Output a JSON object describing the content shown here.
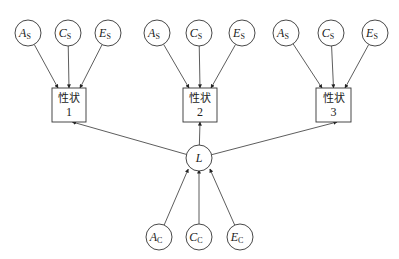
{
  "diagram": {
    "type": "path-diagram",
    "top_groups": [
      {
        "nodes": [
          {
            "letter": "A",
            "sub": "S",
            "x": 28
          },
          {
            "letter": "C",
            "sub": "S",
            "x": 68
          },
          {
            "letter": "E",
            "sub": "S",
            "x": 108
          }
        ],
        "trait": {
          "label": "性状",
          "number": "1",
          "x": 52,
          "w": 34
        }
      },
      {
        "nodes": [
          {
            "letter": "A",
            "sub": "S",
            "x": 157
          },
          {
            "letter": "C",
            "sub": "S",
            "x": 199
          },
          {
            "letter": "E",
            "sub": "S",
            "x": 242
          }
        ],
        "trait": {
          "label": "性状",
          "number": "2",
          "x": 183,
          "w": 34
        }
      },
      {
        "nodes": [
          {
            "letter": "A",
            "sub": "S",
            "x": 286
          },
          {
            "letter": "C",
            "sub": "S",
            "x": 331
          },
          {
            "letter": "E",
            "sub": "S",
            "x": 375
          }
        ],
        "trait": {
          "label": "性状",
          "number": "3",
          "x": 316,
          "w": 35
        }
      }
    ],
    "latent": {
      "letter": "L",
      "x": 199,
      "y": 158
    },
    "bottom_nodes": [
      {
        "letter": "A",
        "sub": "C",
        "x": 159
      },
      {
        "letter": "C",
        "sub": "C",
        "x": 199
      },
      {
        "letter": "E",
        "sub": "C",
        "x": 240
      }
    ],
    "colors": {
      "stroke": "#333333",
      "text": "#222222"
    }
  }
}
